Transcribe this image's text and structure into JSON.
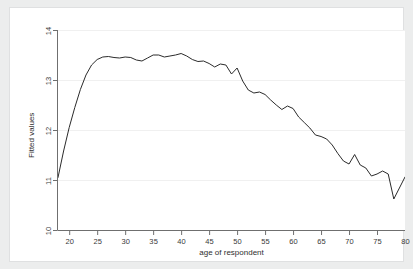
{
  "chart_data": {
    "type": "line",
    "title": "",
    "subtitle": "",
    "xlabel": "age of respondent",
    "ylabel": "Fitted values",
    "xlim": [
      18,
      80
    ],
    "ylim": [
      10,
      14
    ],
    "xticks": [
      20,
      25,
      30,
      35,
      40,
      45,
      50,
      55,
      60,
      65,
      70,
      75,
      80
    ],
    "yticks": [
      10,
      11,
      12,
      13,
      14
    ],
    "grid": "horizontal",
    "legend": "none",
    "line_color": "#2b2b2b",
    "background_color": "#eceded",
    "plot_background_color": "#ffffff",
    "gridline_color": "#f0f0f0",
    "x": [
      18,
      19,
      20,
      21,
      22,
      23,
      24,
      25,
      26,
      27,
      28,
      29,
      30,
      31,
      32,
      33,
      34,
      35,
      36,
      37,
      38,
      39,
      40,
      41,
      42,
      43,
      44,
      45,
      46,
      47,
      48,
      49,
      50,
      51,
      52,
      53,
      54,
      55,
      56,
      57,
      58,
      59,
      60,
      61,
      62,
      63,
      64,
      65,
      66,
      67,
      68,
      69,
      70,
      71,
      72,
      73,
      74,
      75,
      76,
      77,
      78,
      79,
      80
    ],
    "y": [
      11.05,
      11.58,
      12.05,
      12.45,
      12.81,
      13.1,
      13.3,
      13.41,
      13.46,
      13.47,
      13.45,
      13.44,
      13.46,
      13.45,
      13.4,
      13.38,
      13.44,
      13.5,
      13.5,
      13.46,
      13.48,
      13.5,
      13.53,
      13.48,
      13.41,
      13.37,
      13.38,
      13.33,
      13.26,
      13.32,
      13.3,
      13.12,
      13.24,
      12.98,
      12.8,
      12.74,
      12.76,
      12.71,
      12.6,
      12.5,
      12.41,
      12.48,
      12.43,
      12.26,
      12.15,
      12.04,
      11.9,
      11.87,
      11.82,
      11.7,
      11.53,
      11.38,
      11.32,
      11.51,
      11.3,
      11.24,
      11.08,
      11.12,
      11.18,
      11.12,
      10.62,
      10.84,
      11.06
    ],
    "series_name": "Fitted values"
  }
}
